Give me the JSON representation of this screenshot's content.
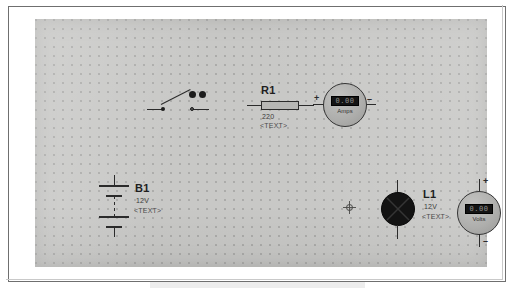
{
  "document": {
    "type": "circuit-schematic",
    "background_color": "#c8c8c6",
    "ink_color": "#2b2b2b",
    "page_border_color": "#6f6f6f"
  },
  "components": {
    "switch": {
      "name": "switch",
      "symbol": "spst-open-switch",
      "state": "open"
    },
    "resistor": {
      "name": "resistor",
      "reference": "R1",
      "value": "220",
      "text": "<TEXT>"
    },
    "ammeter": {
      "name": "ammeter",
      "unit_label": "Amps",
      "display_value": "0.00",
      "plus_terminal": "+",
      "minus_terminal": "–",
      "display_color": "#141414"
    },
    "battery": {
      "name": "battery",
      "reference": "B1",
      "value": "12V",
      "text": "<TEXT>"
    },
    "lamp": {
      "name": "lamp",
      "reference": "L1",
      "value": "12V",
      "text": "<TEXT>",
      "bulb_color": "#131313"
    },
    "voltmeter": {
      "name": "voltmeter",
      "unit_label": "Volts",
      "display_value": "0.00",
      "plus_terminal": "+",
      "minus_terminal": "–",
      "display_color": "#141414"
    },
    "cursor": {
      "name": "crosshair-cursor"
    }
  }
}
